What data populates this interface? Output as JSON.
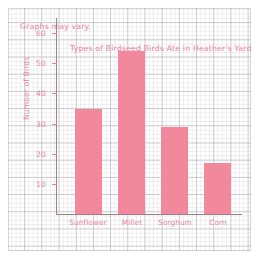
{
  "note": "Graphs may vary.",
  "chart_data": {
    "type": "bar",
    "title": "Types of Birdseed Birds Ate in Heather's Yard",
    "xlabel": "",
    "ylabel": "Number of Birds",
    "categories": [
      "Sunflower",
      "Millet",
      "Sorghum",
      "Corn"
    ],
    "values": [
      35,
      54,
      29,
      17
    ],
    "ylim": [
      0,
      65
    ],
    "yticks": [
      10,
      20,
      30,
      40,
      50,
      60
    ],
    "ytick_labels": [
      "10",
      "20",
      "30",
      "40",
      "50",
      "60"
    ],
    "grid": true,
    "legend": "none",
    "bar_color": "#f2889c",
    "text_color": "#e8849b",
    "axis_color": "#9b8189"
  }
}
